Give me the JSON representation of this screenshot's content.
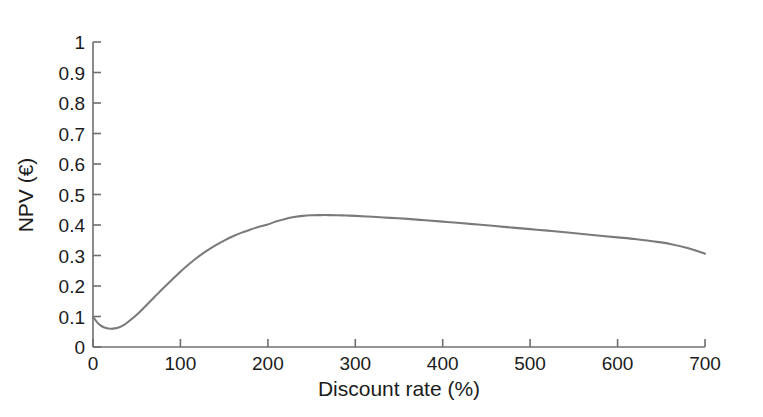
{
  "chart_data": {
    "type": "line",
    "title": "",
    "xlabel": "Discount rate (%)",
    "ylabel": "NPV (€)",
    "xlim": [
      0,
      700
    ],
    "ylim": [
      0,
      1
    ],
    "xticks": [
      0,
      100,
      200,
      300,
      400,
      500,
      600,
      700
    ],
    "xtick_labels": [
      "0",
      "100",
      "200",
      "300",
      "400",
      "500",
      "600",
      "700"
    ],
    "yticks": [
      0,
      0.1,
      0.2,
      0.3,
      0.4,
      0.5,
      0.6,
      0.7,
      0.8,
      0.9,
      1
    ],
    "ytick_labels": [
      "0",
      "0.1",
      "0.2",
      "0.3",
      "0.4",
      "0.5",
      "0.6",
      "0.7",
      "0.8",
      "0.9",
      "1"
    ],
    "grid": false,
    "legend": null,
    "legend_position": "none",
    "line_color": "#7a7a7a",
    "axis_color": "#6f6f6f",
    "background_color": "#ffffff",
    "series": [
      {
        "name": "NPV",
        "x": [
          0,
          5,
          10,
          15,
          20,
          25,
          30,
          35,
          40,
          50,
          60,
          70,
          80,
          90,
          100,
          110,
          120,
          130,
          140,
          150,
          160,
          170,
          180,
          190,
          200,
          210,
          220,
          230,
          240,
          250,
          260,
          270,
          280,
          290,
          300,
          320,
          340,
          360,
          380,
          400,
          420,
          440,
          460,
          480,
          500,
          520,
          540,
          560,
          580,
          600,
          620,
          640,
          660,
          680,
          700
        ],
        "y": [
          0.1,
          0.08,
          0.068,
          0.062,
          0.06,
          0.061,
          0.065,
          0.072,
          0.082,
          0.106,
          0.134,
          0.163,
          0.192,
          0.22,
          0.247,
          0.272,
          0.295,
          0.315,
          0.333,
          0.349,
          0.363,
          0.375,
          0.385,
          0.394,
          0.402,
          0.412,
          0.42,
          0.426,
          0.43,
          0.432,
          0.4325,
          0.4325,
          0.432,
          0.4312,
          0.43,
          0.427,
          0.4235,
          0.42,
          0.4155,
          0.411,
          0.4065,
          0.4015,
          0.3965,
          0.3915,
          0.3865,
          0.3815,
          0.376,
          0.3705,
          0.365,
          0.3595,
          0.354,
          0.3465,
          0.338,
          0.3245,
          0.306
        ]
      }
    ],
    "annotations": []
  }
}
